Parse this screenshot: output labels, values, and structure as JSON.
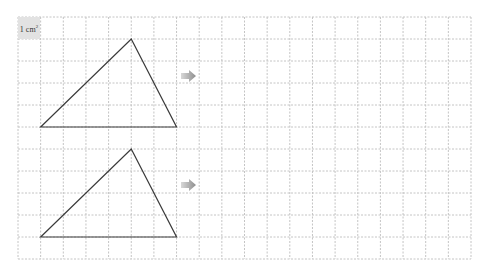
{
  "grid": {
    "left": 18,
    "top": 17,
    "cols": 20,
    "rows": 11,
    "cell_w": 22.65,
    "cell_h": 22,
    "line_color": "#c4c4c4"
  },
  "unit_label": {
    "text": "1 cm",
    "sup": "2"
  },
  "shapes": [
    {
      "name": "triangle-top",
      "points": [
        [
          1,
          5
        ],
        [
          5,
          1
        ],
        [
          7,
          5
        ]
      ]
    },
    {
      "name": "triangle-bottom",
      "points": [
        [
          1,
          10
        ],
        [
          5,
          6
        ],
        [
          7,
          10
        ]
      ]
    }
  ],
  "arrows": [
    {
      "name": "arrow-top",
      "x": 181,
      "y": 76
    },
    {
      "name": "arrow-bottom",
      "x": 181,
      "y": 185
    }
  ],
  "colors": {
    "stroke": "#3a3a3a",
    "arrow": "#a8a8a8"
  }
}
